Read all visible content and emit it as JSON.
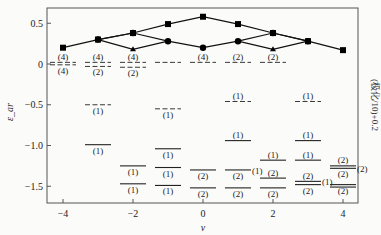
{
  "chart_data": {
    "type": "scatter",
    "title": "",
    "xlabel": "ν",
    "ylabel": "ε_ar",
    "side_note": "(极化/10)+0.2",
    "xlim": [
      -4.5,
      4.5
    ],
    "ylim": [
      -1.7,
      0.7
    ],
    "x_ticks": [
      -4,
      -2,
      0,
      2,
      4
    ],
    "x_tick_labels": [
      "−4",
      "−2",
      "0",
      "2",
      "4"
    ],
    "y_ticks": [
      0.5,
      0,
      -0.5,
      -1.0,
      -1.5
    ],
    "y_tick_labels": [
      "0.5",
      "0",
      "−0.5",
      "−1.0",
      "−1.5"
    ],
    "grid": false,
    "polarization_series": [
      {
        "name": "squares",
        "marker": "square",
        "points": [
          [
            -4,
            0.2
          ],
          [
            -3,
            0.3
          ],
          [
            -2,
            0.38
          ],
          [
            -1,
            0.49
          ],
          [
            0,
            0.58
          ],
          [
            1,
            0.49
          ],
          [
            2,
            0.38
          ],
          [
            3,
            0.28
          ],
          [
            4,
            0.17
          ]
        ]
      },
      {
        "name": "circles",
        "marker": "circle",
        "points": [
          [
            -3,
            0.3
          ],
          [
            -2,
            0.38
          ],
          [
            -1,
            0.28
          ],
          [
            0,
            0.2
          ],
          [
            1,
            0.28
          ],
          [
            2,
            0.38
          ],
          [
            3,
            0.28
          ]
        ]
      },
      {
        "name": "triangles",
        "marker": "triangle",
        "points": [
          [
            -2,
            0.18
          ],
          [
            2,
            0.18
          ]
        ]
      }
    ],
    "polarization_lines": [
      [
        [
          -4,
          0.2
        ],
        [
          -3,
          0.3
        ],
        [
          -2,
          0.38
        ],
        [
          -1,
          0.49
        ],
        [
          0,
          0.58
        ],
        [
          1,
          0.49
        ],
        [
          2,
          0.38
        ],
        [
          3,
          0.28
        ],
        [
          4,
          0.17
        ]
      ],
      [
        [
          -3,
          0.3
        ],
        [
          -2,
          0.38
        ],
        [
          -1,
          0.28
        ],
        [
          0,
          0.2
        ],
        [
          1,
          0.28
        ],
        [
          2,
          0.38
        ],
        [
          3,
          0.28
        ]
      ],
      [
        [
          -3,
          0.3
        ],
        [
          -2,
          0.18
        ],
        [
          -1,
          0.28
        ]
      ],
      [
        [
          1,
          0.28
        ],
        [
          2,
          0.18
        ],
        [
          3,
          0.28
        ]
      ]
    ],
    "levels": [
      {
        "nu": -4,
        "y": 0.02,
        "style": "dashed",
        "label": "(4)",
        "label_pos": "above"
      },
      {
        "nu": -4,
        "y": -0.01,
        "style": "dashed",
        "label": "(4)",
        "label_pos": "below"
      },
      {
        "nu": -3,
        "y": 0.02,
        "style": "dashed",
        "label": "(4)",
        "label_pos": "above"
      },
      {
        "nu": -3,
        "y": -0.03,
        "style": "dashed",
        "label": "(2)",
        "label_pos": "below"
      },
      {
        "nu": -3,
        "y": -0.5,
        "style": "dashed",
        "label": "(1)",
        "label_pos": "below"
      },
      {
        "nu": -3,
        "y": -0.99,
        "style": "solid",
        "label": "(1)",
        "label_pos": "below"
      },
      {
        "nu": -2,
        "y": 0.02,
        "style": "dashed",
        "label": "(4)",
        "label_pos": "above"
      },
      {
        "nu": -2,
        "y": -0.04,
        "style": "dashed",
        "label": "(2)",
        "label_pos": "below"
      },
      {
        "nu": -2,
        "y": -1.25,
        "style": "solid",
        "label": "(1)",
        "label_pos": "below"
      },
      {
        "nu": -2,
        "y": -1.47,
        "style": "solid",
        "label": "(1)",
        "label_pos": "below"
      },
      {
        "nu": -1,
        "y": 0.02,
        "style": "dashed",
        "label": "",
        "label_pos": "none"
      },
      {
        "nu": -1,
        "y": -0.55,
        "style": "dashed",
        "label": "(1)",
        "label_pos": "below"
      },
      {
        "nu": -1,
        "y": -1.04,
        "style": "solid",
        "label": "(1)",
        "label_pos": "below"
      },
      {
        "nu": -1,
        "y": -1.27,
        "style": "solid",
        "label": "(1)",
        "label_pos": "below"
      },
      {
        "nu": -1,
        "y": -1.49,
        "style": "solid",
        "label": "(1)",
        "label_pos": "below"
      },
      {
        "nu": 0,
        "y": 0.02,
        "style": "dashed",
        "label": "(4)",
        "label_pos": "above"
      },
      {
        "nu": 0,
        "y": -1.3,
        "style": "solid",
        "label": "(2)",
        "label_pos": "below"
      },
      {
        "nu": 0,
        "y": -1.52,
        "style": "solid",
        "label": "(2)",
        "label_pos": "below"
      },
      {
        "nu": 1,
        "y": 0.02,
        "style": "dashed",
        "label": "(2)",
        "label_pos": "above"
      },
      {
        "nu": 1,
        "y": -0.46,
        "style": "dashed",
        "label": "(1)",
        "label_pos": "above"
      },
      {
        "nu": 1,
        "y": -0.94,
        "style": "solid",
        "label": "(1)",
        "label_pos": "above"
      },
      {
        "nu": 1,
        "y": -1.3,
        "style": "solid",
        "label": "(2)",
        "label_pos": "below",
        "side_label": "(1)"
      },
      {
        "nu": 1,
        "y": -1.52,
        "style": "solid",
        "label": "(2)",
        "label_pos": "below"
      },
      {
        "nu": 2,
        "y": 0.02,
        "style": "dashed",
        "label": "(2)",
        "label_pos": "above"
      },
      {
        "nu": 2,
        "y": -1.18,
        "style": "solid",
        "label": "(1)",
        "label_pos": "above"
      },
      {
        "nu": 2,
        "y": -1.4,
        "style": "solid",
        "label": "(2)",
        "label_pos": "above"
      },
      {
        "nu": 2,
        "y": -1.52,
        "style": "solid",
        "label": "(2)",
        "label_pos": "below"
      },
      {
        "nu": 3,
        "y": -0.46,
        "style": "dashed",
        "label": "(1)",
        "label_pos": "above"
      },
      {
        "nu": 3,
        "y": -0.94,
        "style": "solid",
        "label": "(1)",
        "label_pos": "above"
      },
      {
        "nu": 3,
        "y": -1.18,
        "style": "solid",
        "label": "(1)",
        "label_pos": "above"
      },
      {
        "nu": 3,
        "y": -1.44,
        "style": "solid",
        "label": "(2)",
        "label_pos": "above",
        "side_label": "(1)"
      },
      {
        "nu": 3,
        "y": -1.48,
        "style": "solid",
        "label": "(2)",
        "label_pos": "below"
      },
      {
        "nu": 4,
        "y": -1.25,
        "style": "solid",
        "label": "(2)",
        "label_pos": "above"
      },
      {
        "nu": 4,
        "y": -1.28,
        "style": "solid",
        "label": "(2)",
        "label_pos": "below",
        "side_label": "(2)"
      },
      {
        "nu": 4,
        "y": -1.48,
        "style": "solid",
        "label": "(2)",
        "label_pos": "below"
      },
      {
        "nu": 4,
        "y": -1.51,
        "style": "solid",
        "label": "",
        "label_pos": "none"
      }
    ]
  }
}
